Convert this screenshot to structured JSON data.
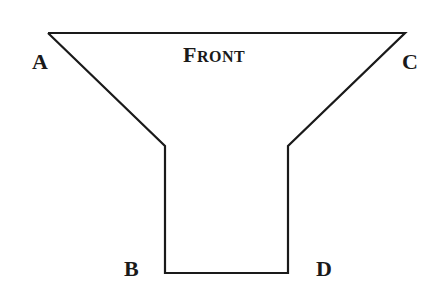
{
  "diagram": {
    "title_first": "F",
    "title_rest": "RONT",
    "labels": {
      "a": "A",
      "b": "B",
      "c": "C",
      "d": "D"
    },
    "stroke_color": "#1a1a1a",
    "background": "#ffffff"
  }
}
